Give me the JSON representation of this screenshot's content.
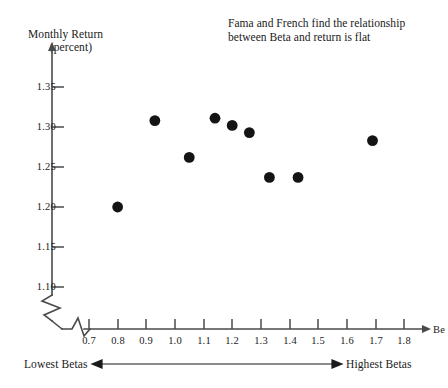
{
  "figure": {
    "y_axis_label_line1": "Monthly Return",
    "y_axis_label_line2": "(percent)",
    "x_axis_name": "Be",
    "annotation_line1": "Fama and French find the relationship",
    "annotation_line2": "between Beta and return is flat",
    "range_label_left": "Lowest Betas",
    "range_label_right": "Highest Betas"
  },
  "chart_data": {
    "type": "scatter",
    "title": "",
    "annotation": "Fama and French find the relationship between Beta and return is flat",
    "xlabel": "Be",
    "ylabel": "Monthly Return (percent)",
    "xlim": [
      0.65,
      1.85
    ],
    "ylim": [
      1.085,
      1.375
    ],
    "grid": false,
    "legend": null,
    "axis_break_x": true,
    "axis_break_y": true,
    "xticks": [
      0.7,
      0.8,
      0.9,
      1.0,
      1.1,
      1.2,
      1.3,
      1.4,
      1.5,
      1.6,
      1.7,
      1.8
    ],
    "xtick_labels": [
      "0.7",
      "0.8",
      "0.9",
      "1.0",
      "1.1",
      "1.2",
      "1.3",
      "1.4",
      "1.5",
      "1.6",
      "1.7",
      "1.8"
    ],
    "yticks": [
      1.1,
      1.15,
      1.2,
      1.25,
      1.3,
      1.35
    ],
    "ytick_labels": [
      "1.10",
      "1.15",
      "1.20",
      "1.25",
      "1.30",
      "1.35"
    ],
    "marker": "filled-circle",
    "marker_color": "#141414",
    "marker_size": 9,
    "x": [
      0.8,
      0.93,
      1.05,
      1.14,
      1.2,
      1.26,
      1.33,
      1.43,
      1.69
    ],
    "y": [
      1.2,
      1.308,
      1.262,
      1.311,
      1.302,
      1.293,
      1.237,
      1.237,
      1.283
    ],
    "points": [
      {
        "beta": 0.8,
        "return": 1.2
      },
      {
        "beta": 0.93,
        "return": 1.308
      },
      {
        "beta": 1.05,
        "return": 1.262
      },
      {
        "beta": 1.14,
        "return": 1.311
      },
      {
        "beta": 1.2,
        "return": 1.302
      },
      {
        "beta": 1.26,
        "return": 1.293
      },
      {
        "beta": 1.33,
        "return": 1.237
      },
      {
        "beta": 1.43,
        "return": 1.237
      },
      {
        "beta": 1.69,
        "return": 1.283
      }
    ]
  },
  "colors": {
    "axis": "#4a4a4a",
    "marker": "#141414",
    "text": "#1a1a1a"
  }
}
